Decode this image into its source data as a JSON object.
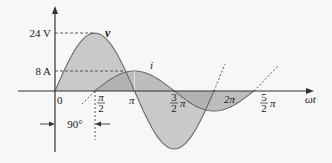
{
  "diagram": {
    "type": "ac-waveforms-phase-shift",
    "colors": {
      "background": "#f7f7f7",
      "v_fill": "#c9c9c9",
      "i_fill": "#a9a9a9",
      "overlap_fill": "#8e8e8e",
      "curve_stroke": "#6a6a6a",
      "axis": "#333333"
    },
    "curves": [
      {
        "name": "v",
        "label": "v",
        "amplitude": 24,
        "unit": "V",
        "phase_deg": 0,
        "formula": "24 sin(ωt)"
      },
      {
        "name": "i",
        "label": "i",
        "amplitude": 8,
        "unit": "A",
        "phase_deg": -90,
        "formula": "8 sin(ωt − 90°)"
      }
    ],
    "y_labels": [
      {
        "text": "24 V",
        "value": 24
      },
      {
        "text": "8 A",
        "value": 8
      }
    ],
    "x_axis_label": "ωt",
    "x_ticks": [
      {
        "text": "0",
        "value_pi": 0
      },
      {
        "num": "π",
        "den": "2",
        "value_pi": 0.5
      },
      {
        "text": "π",
        "value_pi": 1
      },
      {
        "num": "3",
        "den": "2",
        "suffix": "π",
        "value_pi": 1.5
      },
      {
        "text": "2π",
        "value_pi": 2
      },
      {
        "num": "5",
        "den": "2",
        "suffix": "π",
        "value_pi": 2.5
      }
    ],
    "phase_annotation": "90°"
  }
}
